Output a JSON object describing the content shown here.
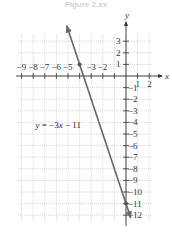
{
  "figure": {
    "title": "Figure 2.xx"
  },
  "chart_data": {
    "type": "line",
    "title": "Figure 2.xx",
    "xlabel": "x",
    "ylabel": "y",
    "xlim": [
      -9.3,
      2.2
    ],
    "ylim": [
      -12.6,
      3.6
    ],
    "grid": true,
    "x_ticks": [
      -9,
      -8,
      -7,
      -6,
      -5,
      -4,
      -3,
      -2,
      -1,
      1,
      2
    ],
    "x_tick_labels": [
      "−9",
      "−8",
      "−7",
      "−6",
      "−5",
      "−3",
      "−2",
      "1",
      "2"
    ],
    "y_ticks": [
      3,
      2,
      1,
      -1,
      -2,
      -3,
      -4,
      -5,
      -6,
      -7,
      -8,
      -9,
      -10,
      -11,
      -12
    ],
    "y_tick_labels": [
      "3",
      "2",
      "1",
      "−1",
      "−2",
      "−3",
      "−4",
      "−5",
      "−6",
      "−7",
      "−8",
      "−9",
      "−10",
      "−11",
      "−12"
    ],
    "series": [
      {
        "name": "y = −3x − 11",
        "equation": "y = −3x − 11",
        "slope": -3,
        "intercept": -11,
        "x": [
          -5.1,
          0.4
        ],
        "y": [
          4.3,
          -12.2
        ],
        "color": "#666666"
      }
    ],
    "points": [
      {
        "x": -4,
        "y": 1,
        "label": ""
      },
      {
        "x": 0,
        "y": -11,
        "label": ""
      }
    ],
    "annotations": [
      {
        "text": "y = −3x − 11",
        "x": -7.8,
        "y": -4.5
      }
    ]
  },
  "colors": {
    "grid": "#b8b8b8",
    "axis": "#333333",
    "line": "#6a6a6a",
    "text": "#333333"
  }
}
